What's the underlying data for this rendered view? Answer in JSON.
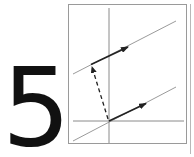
{
  "figure": {
    "label": "5",
    "colors": {
      "frame": "#9a9a9a",
      "axes": "#8a8a8a",
      "thin_lines": "#8f8f8f",
      "vectors": "#222222",
      "numeral": "#111111"
    },
    "elements": [
      "axes",
      "two parallel lines",
      "vector along lower line from origin",
      "vector along upper line",
      "dashed vector from origin to upper line"
    ]
  }
}
